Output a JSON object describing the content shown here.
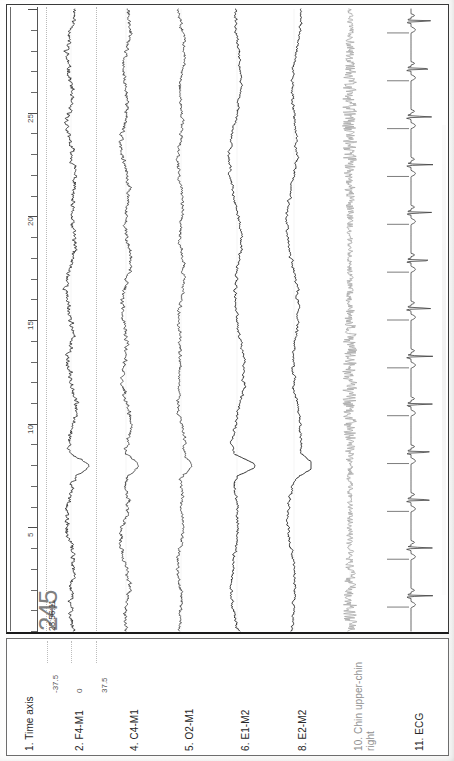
{
  "document": {
    "type": "polysomnography-epoch",
    "epoch_number": "245",
    "epoch_time": "23:56:11"
  },
  "time_axis": {
    "label": "1. Time axis",
    "unit": "s",
    "min": 0,
    "max": 30,
    "major_tick_step": 5,
    "minor_tick_step": 1,
    "tick_labels": [
      "5",
      "10",
      "15",
      "20",
      "25"
    ],
    "tick_values": [
      5,
      10,
      15,
      20,
      25
    ]
  },
  "amplitude_scale": {
    "labels": [
      "-37.5",
      "0",
      "37.5"
    ],
    "values": [
      -37.5,
      0,
      37.5
    ],
    "unit": "uV"
  },
  "channels": [
    {
      "index": "1",
      "label": "1. Time axis",
      "name": "Time axis",
      "color": "#262626",
      "kind": "axis"
    },
    {
      "index": "2",
      "label": "2. F4-M1",
      "name": "F4-M1",
      "color": "#262626",
      "kind": "eeg"
    },
    {
      "index": "4",
      "label": "4. C4-M1",
      "name": "C4-M1",
      "color": "#262626",
      "kind": "eeg"
    },
    {
      "index": "5",
      "label": "5. O2-M1",
      "name": "O2-M1",
      "color": "#262626",
      "kind": "eeg"
    },
    {
      "index": "6",
      "label": "6. E1-M2",
      "name": "E1-M2",
      "color": "#262626",
      "kind": "eog"
    },
    {
      "index": "8",
      "label": "8. E2-M2",
      "name": "E2-M2",
      "color": "#262626",
      "kind": "eog"
    },
    {
      "index": "10",
      "label": "10. Chin upper-chin",
      "label_line2": "right",
      "name": "Chin upper-chin right",
      "color": "#8f8f8f",
      "kind": "emg"
    },
    {
      "index": "11",
      "label": "11. ECG",
      "name": "ECG",
      "color": "#262626",
      "kind": "ecg"
    }
  ],
  "chart_data": {
    "type": "line",
    "subtitle": "23:56:11",
    "xlabel": "1. Time axis",
    "ylabel": "Amplitude (uV)",
    "xlim": [
      0,
      30
    ],
    "ylim": [
      -37.5,
      37.5
    ],
    "grid": "dotted-vertical-rails",
    "legend": "none",
    "orientation": "rotated-90-traces-run-vertically",
    "x_tick_labels": [
      "5",
      "10",
      "15",
      "20",
      "25"
    ],
    "y_tick_labels": [
      "-37.5",
      "0",
      "37.5"
    ],
    "series": [
      {
        "name": "F4-M1",
        "channel": "2",
        "kind": "eeg",
        "color": "#2e2e2e",
        "amplitude_uv": 37.5,
        "description": "EEG frontal, mixed-frequency 1-16 Hz, moderate amplitude, K-complex near t=8s"
      },
      {
        "name": "C4-M1",
        "channel": "4",
        "kind": "eeg",
        "color": "#3a3a3a",
        "amplitude_uv": 37.5,
        "description": "EEG central, mixed-frequency, slow waves with spindle bursts"
      },
      {
        "name": "O2-M1",
        "channel": "5",
        "kind": "eeg",
        "color": "#3a3a3a",
        "amplitude_uv": 37.5,
        "description": "EEG occipital, lower amplitude mixed frequency"
      },
      {
        "name": "E1-M2",
        "channel": "6",
        "kind": "eog",
        "color": "#262626",
        "amplitude_uv": 37.5,
        "description": "Left EOG, slow eye movement deflection near t=8s"
      },
      {
        "name": "E2-M2",
        "channel": "8",
        "kind": "eog",
        "color": "#262626",
        "amplitude_uv": 37.5,
        "description": "Right EOG, slow eye movement deflection near t=8s"
      },
      {
        "name": "Chin upper-chin right",
        "channel": "10",
        "kind": "emg",
        "color": "#a8a8a8",
        "amplitude_uv": 37.5,
        "description": "Chin EMG, dense high-frequency low-amplitude tonic activity"
      },
      {
        "name": "ECG",
        "channel": "11",
        "kind": "ecg",
        "color": "#3f3f3f",
        "amplitude_uv": 37.5,
        "description": "ECG, regular sinus rhythm, 13 QRS complexes across the 30 s epoch"
      }
    ]
  }
}
